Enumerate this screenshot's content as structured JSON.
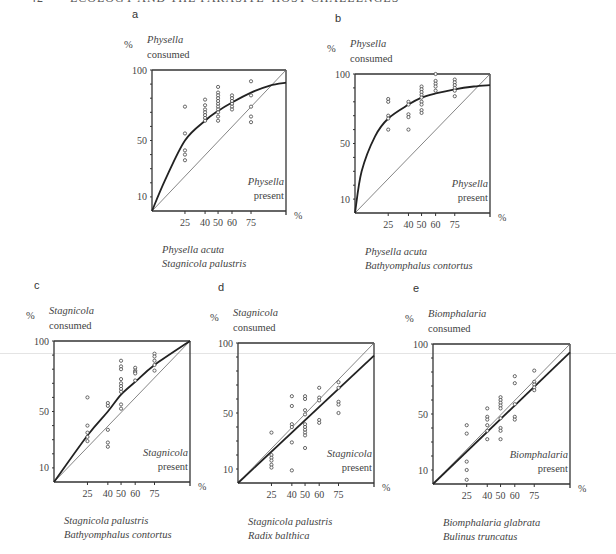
{
  "page": {
    "running_head_page": "42",
    "running_head_title": "ECOLOGY AND THE PARASITE–HOST CHALLENGES"
  },
  "chart_data": [
    {
      "id": "a",
      "type": "scatter",
      "panel_label": "a",
      "ylabel_unit": "%",
      "ylabel_species": "Physella",
      "ylabel_text": "consumed",
      "xlabel_species": "Physella",
      "xlabel_text": "present",
      "xlabel_unit": "%",
      "yticks": [
        100,
        50,
        10
      ],
      "xticks": [
        25,
        40,
        50,
        60,
        75
      ],
      "caption_line1": "Physella acuta",
      "caption_line2": "Stagnicola palustris",
      "fit": "concave",
      "points": [
        [
          25,
          74
        ],
        [
          25,
          55
        ],
        [
          25,
          43
        ],
        [
          25,
          40
        ],
        [
          25,
          36
        ],
        [
          40,
          79
        ],
        [
          40,
          75
        ],
        [
          40,
          72
        ],
        [
          40,
          70
        ],
        [
          40,
          68
        ],
        [
          40,
          66
        ],
        [
          40,
          64
        ],
        [
          50,
          88
        ],
        [
          50,
          84
        ],
        [
          50,
          82
        ],
        [
          50,
          80
        ],
        [
          50,
          78
        ],
        [
          50,
          76
        ],
        [
          50,
          74
        ],
        [
          50,
          72
        ],
        [
          50,
          70
        ],
        [
          50,
          67
        ],
        [
          50,
          64
        ],
        [
          60,
          82
        ],
        [
          60,
          80
        ],
        [
          60,
          78
        ],
        [
          60,
          76
        ],
        [
          60,
          74
        ],
        [
          60,
          72
        ],
        [
          75,
          92
        ],
        [
          75,
          82
        ],
        [
          75,
          74
        ],
        [
          75,
          67
        ],
        [
          75,
          63
        ]
      ],
      "curve": [
        [
          0,
          0
        ],
        [
          10,
          22
        ],
        [
          25,
          50
        ],
        [
          40,
          64
        ],
        [
          50,
          71
        ],
        [
          60,
          77
        ],
        [
          75,
          84
        ],
        [
          90,
          89
        ],
        [
          100,
          91
        ]
      ]
    },
    {
      "id": "b",
      "type": "scatter",
      "panel_label": "b",
      "ylabel_unit": "%",
      "ylabel_species": "Physella",
      "ylabel_text": "consumed",
      "xlabel_species": "Physella",
      "xlabel_text": "present",
      "xlabel_unit": "%",
      "yticks": [
        100,
        50,
        10
      ],
      "xticks": [
        25,
        40,
        50,
        60,
        75
      ],
      "caption_line1": "Physella acuta",
      "caption_line2": "Bathyomphalus contortus",
      "fit": "concave",
      "points": [
        [
          25,
          82
        ],
        [
          25,
          80
        ],
        [
          25,
          70
        ],
        [
          25,
          68
        ],
        [
          25,
          60
        ],
        [
          40,
          80
        ],
        [
          40,
          78
        ],
        [
          40,
          71
        ],
        [
          40,
          69
        ],
        [
          40,
          60
        ],
        [
          50,
          91
        ],
        [
          50,
          89
        ],
        [
          50,
          87
        ],
        [
          50,
          85
        ],
        [
          50,
          83
        ],
        [
          50,
          80
        ],
        [
          50,
          78
        ],
        [
          50,
          74
        ],
        [
          50,
          72
        ],
        [
          60,
          100
        ],
        [
          60,
          95
        ],
        [
          60,
          93
        ],
        [
          60,
          91
        ],
        [
          60,
          88
        ],
        [
          75,
          96
        ],
        [
          75,
          94
        ],
        [
          75,
          92
        ],
        [
          75,
          90
        ],
        [
          75,
          88
        ],
        [
          75,
          84
        ]
      ],
      "curve": [
        [
          0,
          0
        ],
        [
          5,
          30
        ],
        [
          15,
          55
        ],
        [
          25,
          68
        ],
        [
          40,
          78
        ],
        [
          50,
          83
        ],
        [
          60,
          86
        ],
        [
          75,
          89
        ],
        [
          90,
          91
        ],
        [
          100,
          92
        ]
      ]
    },
    {
      "id": "c",
      "type": "scatter",
      "panel_label": "c",
      "ylabel_unit": "%",
      "ylabel_species": "Stagnicola",
      "ylabel_text": "consumed",
      "xlabel_species": "Stagnicola",
      "xlabel_text": "present",
      "xlabel_unit": "%",
      "yticks": [
        100,
        50,
        10
      ],
      "xticks": [
        25,
        40,
        50,
        60,
        75
      ],
      "caption_line1": "Stagnicola palustris",
      "caption_line2": "Bathyomphalus contortus",
      "fit": "slightly-concave",
      "points": [
        [
          25,
          60
        ],
        [
          25,
          40
        ],
        [
          25,
          35
        ],
        [
          25,
          32
        ],
        [
          25,
          29
        ],
        [
          40,
          56
        ],
        [
          40,
          54
        ],
        [
          40,
          37
        ],
        [
          40,
          28
        ],
        [
          40,
          25
        ],
        [
          50,
          86
        ],
        [
          50,
          82
        ],
        [
          50,
          80
        ],
        [
          50,
          73
        ],
        [
          50,
          70
        ],
        [
          50,
          68
        ],
        [
          50,
          66
        ],
        [
          50,
          64
        ],
        [
          50,
          55
        ],
        [
          50,
          52
        ],
        [
          60,
          81
        ],
        [
          60,
          79
        ],
        [
          60,
          78
        ],
        [
          60,
          77
        ],
        [
          60,
          72
        ],
        [
          75,
          91
        ],
        [
          75,
          89
        ],
        [
          75,
          86
        ],
        [
          75,
          83
        ],
        [
          75,
          79
        ]
      ],
      "curve": [
        [
          0,
          0
        ],
        [
          25,
          33
        ],
        [
          40,
          50
        ],
        [
          50,
          62
        ],
        [
          60,
          71
        ],
        [
          75,
          83
        ],
        [
          100,
          100
        ]
      ]
    },
    {
      "id": "d",
      "type": "scatter",
      "panel_label": "d",
      "ylabel_unit": "%",
      "ylabel_species": "Stagnicola",
      "ylabel_text": "consumed",
      "xlabel_species": "Stagnicola",
      "xlabel_text": "present",
      "xlabel_unit": "%",
      "yticks": [
        100,
        50,
        10
      ],
      "xticks": [
        25,
        40,
        50,
        60,
        75
      ],
      "caption_line1": "Stagnicola palustris",
      "caption_line2": "Radix balthica",
      "fit": "linear",
      "points": [
        [
          25,
          36
        ],
        [
          25,
          20
        ],
        [
          25,
          18
        ],
        [
          25,
          16
        ],
        [
          25,
          13
        ],
        [
          25,
          11
        ],
        [
          40,
          62
        ],
        [
          40,
          55
        ],
        [
          40,
          42
        ],
        [
          40,
          40
        ],
        [
          40,
          29
        ],
        [
          40,
          9
        ],
        [
          50,
          62
        ],
        [
          50,
          60
        ],
        [
          50,
          52
        ],
        [
          50,
          49
        ],
        [
          50,
          42
        ],
        [
          50,
          40
        ],
        [
          50,
          38
        ],
        [
          50,
          36
        ],
        [
          50,
          34
        ],
        [
          50,
          25
        ],
        [
          60,
          68
        ],
        [
          60,
          61
        ],
        [
          60,
          59
        ],
        [
          60,
          45
        ],
        [
          60,
          43
        ],
        [
          75,
          72
        ],
        [
          75,
          68
        ],
        [
          75,
          58
        ],
        [
          75,
          56
        ],
        [
          75,
          50
        ]
      ],
      "curve": [
        [
          0,
          0
        ],
        [
          100,
          91
        ]
      ]
    },
    {
      "id": "e",
      "type": "scatter",
      "panel_label": "e",
      "ylabel_unit": "%",
      "ylabel_species": "Biomphalaria",
      "ylabel_text": "consumed",
      "xlabel_species": "Biomphalaria",
      "xlabel_text": "present",
      "xlabel_unit": "%",
      "yticks": [
        100,
        50,
        10
      ],
      "xticks": [
        25,
        40,
        50,
        60,
        75
      ],
      "caption_line1": "Biomphalaria glabrata",
      "caption_line2": "Bulinus truncatus",
      "fit": "linear",
      "points": [
        [
          25,
          42
        ],
        [
          25,
          36
        ],
        [
          25,
          16
        ],
        [
          25,
          10
        ],
        [
          25,
          3
        ],
        [
          40,
          54
        ],
        [
          40,
          48
        ],
        [
          40,
          46
        ],
        [
          40,
          42
        ],
        [
          40,
          38
        ],
        [
          40,
          32
        ],
        [
          50,
          62
        ],
        [
          50,
          60
        ],
        [
          50,
          58
        ],
        [
          50,
          56
        ],
        [
          50,
          54
        ],
        [
          50,
          47
        ],
        [
          50,
          40
        ],
        [
          50,
          38
        ],
        [
          50,
          32
        ],
        [
          60,
          77
        ],
        [
          60,
          72
        ],
        [
          60,
          57
        ],
        [
          60,
          48
        ],
        [
          60,
          46
        ],
        [
          75,
          81
        ],
        [
          75,
          73
        ],
        [
          75,
          71
        ],
        [
          75,
          69
        ],
        [
          75,
          67
        ]
      ],
      "curve": [
        [
          0,
          0
        ],
        [
          100,
          94
        ]
      ]
    }
  ],
  "x_scale_fractions": {
    "0": 0,
    "25": 0.246,
    "40": 0.396,
    "50": 0.493,
    "60": 0.597,
    "75": 0.739,
    "90": 0.88,
    "100": 1
  }
}
